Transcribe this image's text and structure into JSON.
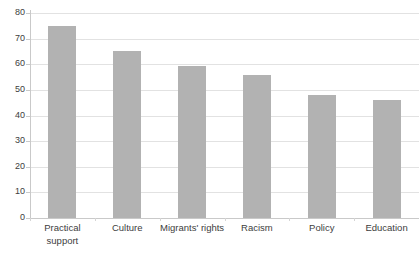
{
  "chart_data": {
    "type": "bar",
    "title": "",
    "subtitle": "",
    "xlabel": "",
    "ylabel": "",
    "categories": [
      "Practical support",
      "Culture",
      "Migrants' rights",
      "Racism",
      "Policy",
      "Education"
    ],
    "values": [
      75,
      65,
      59.5,
      56,
      48,
      46
    ],
    "series": [
      {
        "name": "",
        "values": [
          75,
          65,
          59.5,
          56,
          48,
          46
        ]
      }
    ],
    "ylim": [
      0,
      80
    ],
    "ytick_labels": [
      "80",
      "70",
      "60",
      "50",
      "40",
      "30",
      "20",
      "10",
      "0"
    ],
    "ytick_values": [
      80,
      70,
      60,
      50,
      40,
      30,
      20,
      10,
      0
    ],
    "grid": true,
    "grid_axis": "y",
    "legend": false,
    "legend_position": "none",
    "bar_color": "#b2b2b2",
    "grid_color": "#e2e2e2",
    "axis_color": "#c9c9c9",
    "text_color": "#3d3d3d",
    "background": "#ffffff"
  }
}
